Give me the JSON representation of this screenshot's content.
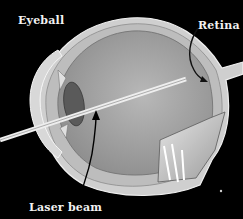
{
  "diagram": {
    "labels": {
      "eyeball": "Eyeball",
      "retina": "Retina",
      "laser_beam": "Laser beam"
    },
    "colors": {
      "background": "#000000",
      "eyeball_interior": "#a9a9a9",
      "sclera": "#d4d4d4",
      "lens": "#5a5a5a",
      "laser": "#e6e6e6",
      "text": "#f2f2f2"
    }
  }
}
